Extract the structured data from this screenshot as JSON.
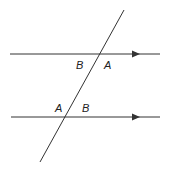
{
  "diagram": {
    "colors": {
      "line": "#333333",
      "background": "#ffffff",
      "text": "#222222"
    },
    "parallel_lines": [
      {
        "id": "top-line",
        "x1": 10,
        "y1": 54,
        "x2": 160,
        "y2": 54,
        "arrow_x": 136
      },
      {
        "id": "bottom-line",
        "x1": 11,
        "y1": 117,
        "x2": 160,
        "y2": 117,
        "arrow_x": 136
      }
    ],
    "transversal": {
      "x1": 124,
      "y1": 10,
      "x2": 40,
      "y2": 162
    },
    "angle_labels": [
      {
        "id": "top-left",
        "text": "B",
        "x": 76,
        "y": 69
      },
      {
        "id": "top-right",
        "text": "A",
        "x": 104,
        "y": 69
      },
      {
        "id": "bottom-left",
        "text": "A",
        "x": 55,
        "y": 112
      },
      {
        "id": "bottom-right",
        "text": "B",
        "x": 82,
        "y": 112
      }
    ]
  }
}
